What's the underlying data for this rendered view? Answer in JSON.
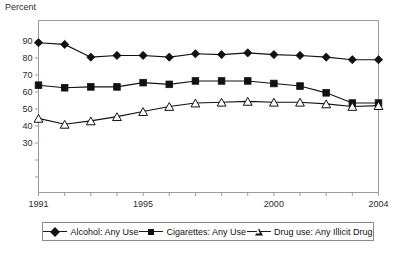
{
  "axis": {
    "ylabel": "Percent",
    "yticks": [
      30,
      40,
      50,
      60,
      70,
      80,
      90
    ],
    "ylim": [
      0,
      95
    ],
    "xticks_labeled": [
      "1991",
      "1995",
      "2000",
      "2004"
    ],
    "xlim": [
      1991,
      2004
    ]
  },
  "legend": {
    "entries": [
      {
        "label": "Alcohol: Any Use",
        "marker": "filled-diamond",
        "color": "#111111"
      },
      {
        "label": "Cigarettes: Any Use",
        "marker": "filled-square",
        "color": "#111111"
      },
      {
        "label": "Drug use: Any Illicit Drug",
        "marker": "open-triangle",
        "color": "#111111"
      }
    ]
  },
  "chart_data": {
    "type": "line",
    "title": "",
    "subtitle": "",
    "xlabel": "",
    "ylabel": "Percent",
    "xlim": [
      1991,
      2004
    ],
    "ylim": [
      0,
      95
    ],
    "grid": false,
    "legend_position": "bottom",
    "x": [
      1991,
      1992,
      1993,
      1994,
      1995,
      1996,
      1997,
      1998,
      1999,
      2000,
      2001,
      2002,
      2003,
      2004
    ],
    "xtick_labels": [
      "1991",
      "",
      "",
      "",
      "1995",
      "",
      "",
      "",
      "",
      "2000",
      "",
      "",
      "",
      "2004"
    ],
    "ytick_labels": [
      "30",
      "40",
      "50",
      "60",
      "70",
      "80",
      "90"
    ],
    "series": [
      {
        "name": "Alcohol: Any Use",
        "marker": "filled-diamond",
        "color": "#111111",
        "values": [
          89,
          88,
          80.5,
          81.5,
          81.5,
          80.5,
          82.5,
          82,
          83,
          82,
          81.5,
          80.5,
          79,
          79
        ]
      },
      {
        "name": "Cigarettes: Any Use",
        "marker": "filled-square",
        "color": "#111111",
        "values": [
          64,
          62.5,
          63,
          63,
          65.5,
          64.5,
          66.5,
          66.5,
          66.5,
          65,
          63.5,
          59.5,
          53.5,
          53.5
        ]
      },
      {
        "name": "Drug use: Any Illicit Drug",
        "marker": "open-triangle",
        "color": "#111111",
        "values": [
          44.5,
          41,
          43,
          45.5,
          48.5,
          51.5,
          53.5,
          54,
          54.5,
          54,
          54,
          53,
          51.5,
          52
        ]
      }
    ]
  }
}
